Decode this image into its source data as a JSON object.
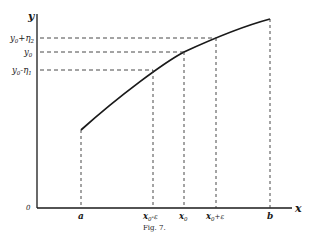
{
  "figure": {
    "caption": "Fig. 7.",
    "axes": {
      "x_label": "x",
      "y_label": "y",
      "origin_label": "0"
    },
    "x_ticks": [
      {
        "label": "a",
        "sub": "",
        "suffix": ""
      },
      {
        "label": "x",
        "sub": "0",
        "suffix": "-ε"
      },
      {
        "label": "x",
        "sub": "0",
        "suffix": ""
      },
      {
        "label": "x",
        "sub": "0",
        "suffix": "+ε"
      },
      {
        "label": "b",
        "sub": "",
        "suffix": ""
      }
    ],
    "y_ticks": [
      {
        "label": "y",
        "sub": "0",
        "suffix": "+η",
        "suffix_sub": "2"
      },
      {
        "label": "y",
        "sub": "0",
        "suffix": "",
        "suffix_sub": ""
      },
      {
        "label": "y",
        "sub": "0",
        "suffix": "-η",
        "suffix_sub": "1"
      }
    ],
    "curve": "increasing concave function from (a, f(a)) to (b, f(b))",
    "colors": {
      "ink": "#1a1a1a",
      "background": "#ffffff"
    }
  }
}
